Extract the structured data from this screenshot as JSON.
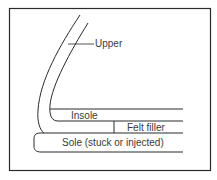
{
  "diagram": {
    "labels": {
      "upper": "Upper",
      "insole": "Insole",
      "felt_filler": "Felt filler",
      "sole": "Sole (stuck or injected)"
    },
    "colors": {
      "line": "#2a2a2a",
      "text": "#3a3a3a",
      "background": "#ffffff"
    }
  }
}
